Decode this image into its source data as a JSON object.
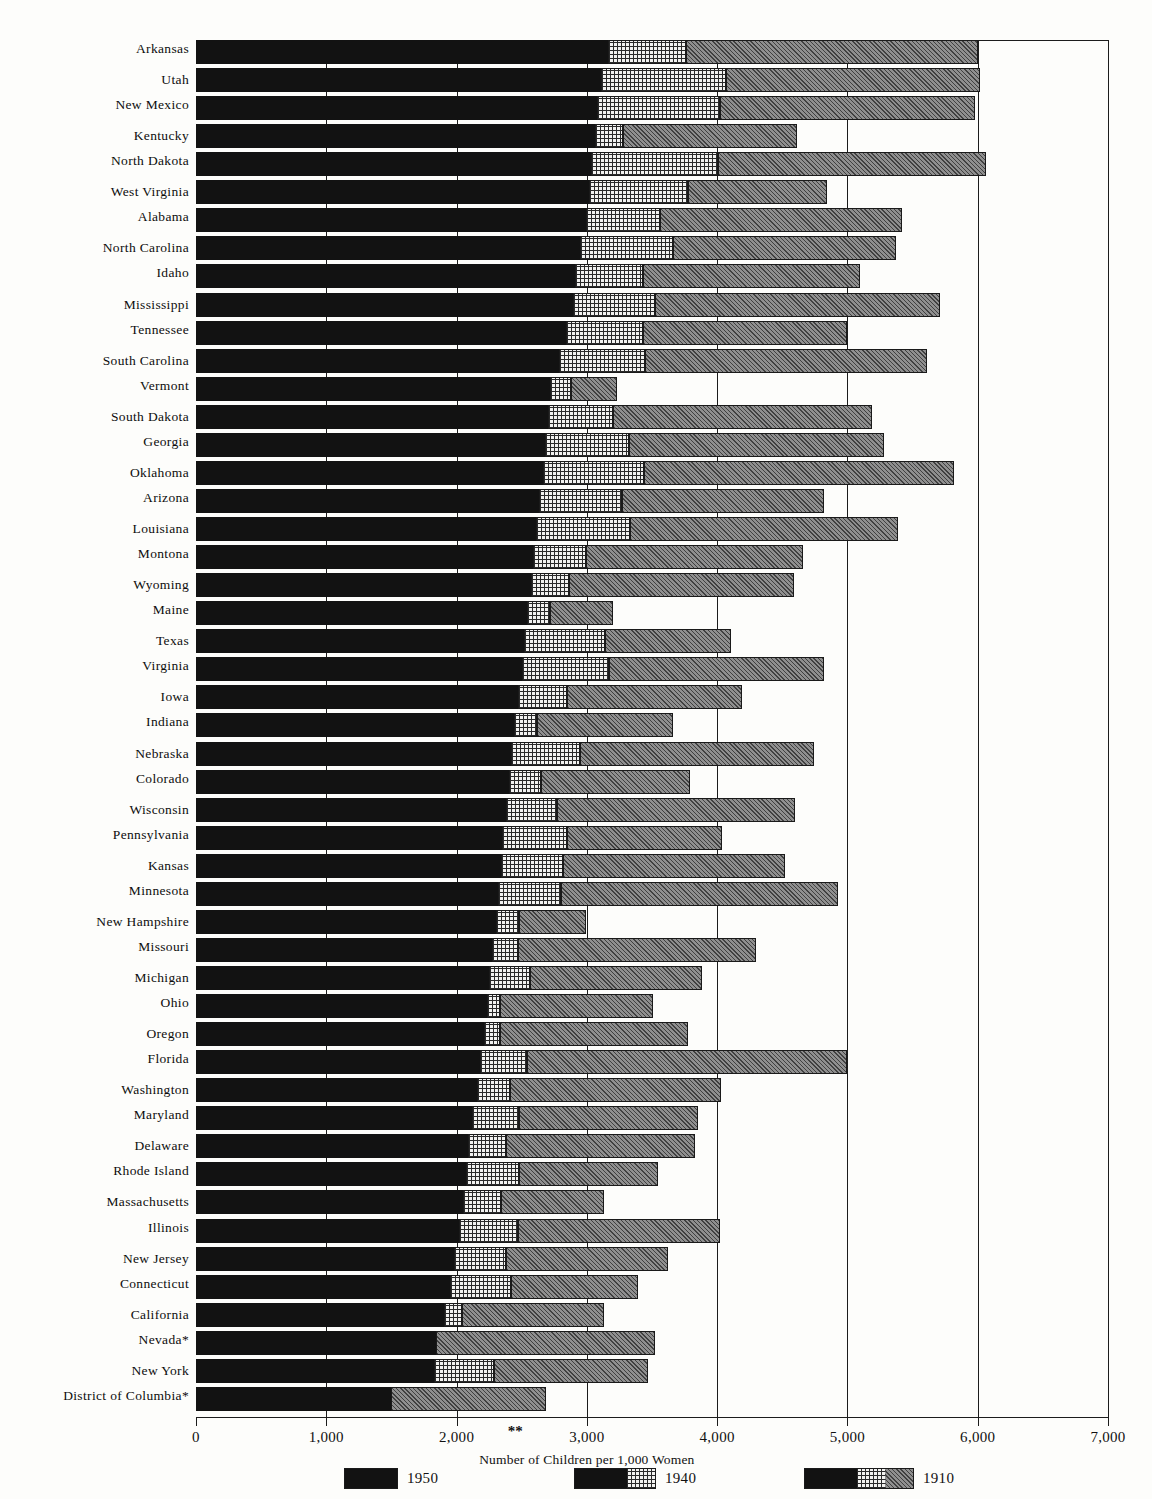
{
  "chart_data": {
    "type": "bar",
    "orientation": "horizontal",
    "subtype": "grouped-overlay-horizontal-bar",
    "title": "",
    "xlabel": "Number of Children per 1,000 Women",
    "ylabel": "",
    "xlim": [
      0,
      7000
    ],
    "xticks": [
      0,
      1000,
      2000,
      3000,
      4000,
      5000,
      6000,
      7000
    ],
    "xtick_labels": [
      "0",
      "1,000",
      "2,000",
      "3,000",
      "4,000",
      "5,000",
      "6,000",
      "7,000"
    ],
    "grid": true,
    "grid_axis": "x",
    "legend_position": "bottom",
    "series": [
      {
        "name": "1950",
        "fill": "solid-black",
        "color": "#121212"
      },
      {
        "name": "1940",
        "fill": "cross-hatch-dot",
        "color": "#f2f2f0"
      },
      {
        "name": "1910",
        "fill": "diagonal-hatch-gray",
        "color": "#8f8f8f"
      }
    ],
    "annotations": [
      "**"
    ],
    "footnote_markers": [
      "*"
    ],
    "categories": [
      "Arkansas",
      "Utah",
      "New Mexico",
      "Kentucky",
      "North Dakota",
      "West Virginia",
      "Alabama",
      "North Carolina",
      "Idaho",
      "Mississippi",
      "Tennessee",
      "South Carolina",
      "Vermont",
      "South Dakota",
      "Georgia",
      "Oklahoma",
      "Arizona",
      "Louisiana",
      "Montona",
      "Wyoming",
      "Maine",
      "Texas",
      "Virginia",
      "Iowa",
      "Indiana",
      "Nebraska",
      "Colorado",
      "Wisconsin",
      "Pennsylvania",
      "Kansas",
      "Minnesota",
      "New Hampshire",
      "Missouri",
      "Michigan",
      "Ohio",
      "Oregon",
      "Florida",
      "Washington",
      "Maryland",
      "Delaware",
      "Rhode Island",
      "Massachusetts",
      "Illinois",
      "New Jersey",
      "Connecticut",
      "California",
      "Nevada*",
      "New York",
      "District of Columbia*"
    ],
    "rows": [
      {
        "state": "Arkansas",
        "v1950": 3160,
        "v1940": 3760,
        "v1910": 6000
      },
      {
        "state": "Utah",
        "v1950": 3110,
        "v1940": 4070,
        "v1910": 6020
      },
      {
        "state": "New Mexico",
        "v1950": 3080,
        "v1940": 4020,
        "v1910": 5980
      },
      {
        "state": "Kentucky",
        "v1950": 3060,
        "v1940": 3280,
        "v1910": 4610
      },
      {
        "state": "North Dakota",
        "v1950": 3030,
        "v1940": 4010,
        "v1910": 6060
      },
      {
        "state": "West Virginia",
        "v1950": 3020,
        "v1940": 3780,
        "v1910": 4840
      },
      {
        "state": "Alabama",
        "v1950": 2990,
        "v1940": 3560,
        "v1910": 5420
      },
      {
        "state": "North Carolina",
        "v1950": 2950,
        "v1940": 3660,
        "v1910": 5370
      },
      {
        "state": "Idaho",
        "v1950": 2910,
        "v1940": 3430,
        "v1910": 5100
      },
      {
        "state": "Mississippi",
        "v1950": 2890,
        "v1940": 3520,
        "v1910": 5710
      },
      {
        "state": "Tennessee",
        "v1950": 2840,
        "v1940": 3430,
        "v1910": 5000
      },
      {
        "state": "South Carolina",
        "v1950": 2790,
        "v1940": 3450,
        "v1910": 5610
      },
      {
        "state": "Vermont",
        "v1950": 2720,
        "v1940": 2880,
        "v1910": 3230
      },
      {
        "state": "South Dakota",
        "v1950": 2700,
        "v1940": 3200,
        "v1910": 5190
      },
      {
        "state": "Georgia",
        "v1950": 2680,
        "v1940": 3320,
        "v1910": 5280
      },
      {
        "state": "Oklahoma",
        "v1950": 2660,
        "v1940": 3440,
        "v1910": 5820
      },
      {
        "state": "Arizona",
        "v1950": 2630,
        "v1940": 3270,
        "v1910": 4820
      },
      {
        "state": "Louisiana",
        "v1950": 2610,
        "v1940": 3330,
        "v1910": 5390
      },
      {
        "state": "Montona",
        "v1950": 2590,
        "v1940": 2990,
        "v1910": 4660
      },
      {
        "state": "Wyoming",
        "v1950": 2570,
        "v1940": 2860,
        "v1910": 4590
      },
      {
        "state": "Maine",
        "v1950": 2540,
        "v1940": 2720,
        "v1910": 3200
      },
      {
        "state": "Texas",
        "v1950": 2520,
        "v1940": 3140,
        "v1910": 4110
      },
      {
        "state": "Virginia",
        "v1950": 2500,
        "v1940": 3170,
        "v1910": 4820
      },
      {
        "state": "Iowa",
        "v1950": 2470,
        "v1940": 2850,
        "v1910": 4190
      },
      {
        "state": "Indiana",
        "v1950": 2440,
        "v1940": 2620,
        "v1910": 3660
      },
      {
        "state": "Nebraska",
        "v1950": 2420,
        "v1940": 2950,
        "v1910": 4740
      },
      {
        "state": "Colorado",
        "v1950": 2400,
        "v1940": 2650,
        "v1910": 3790
      },
      {
        "state": "Wisconsin",
        "v1950": 2380,
        "v1940": 2770,
        "v1910": 4600
      },
      {
        "state": "Pennsylvania",
        "v1950": 2350,
        "v1940": 2850,
        "v1910": 4040
      },
      {
        "state": "Kansas",
        "v1950": 2340,
        "v1940": 2820,
        "v1910": 4520
      },
      {
        "state": "Minnesota",
        "v1950": 2320,
        "v1940": 2800,
        "v1910": 4930
      },
      {
        "state": "New Hampshire",
        "v1950": 2300,
        "v1940": 2480,
        "v1910": 2990
      },
      {
        "state": "Missouri",
        "v1950": 2270,
        "v1940": 2470,
        "v1910": 4300
      },
      {
        "state": "Michigan",
        "v1950": 2250,
        "v1940": 2560,
        "v1910": 3880
      },
      {
        "state": "Ohio",
        "v1950": 2230,
        "v1940": 2330,
        "v1910": 3510
      },
      {
        "state": "Oregon",
        "v1950": 2210,
        "v1940": 2330,
        "v1910": 3780
      },
      {
        "state": "Florida",
        "v1950": 2180,
        "v1940": 2540,
        "v1910": 5000
      },
      {
        "state": "Washington",
        "v1950": 2160,
        "v1940": 2410,
        "v1910": 4030
      },
      {
        "state": "Maryland",
        "v1950": 2120,
        "v1940": 2480,
        "v1910": 3850
      },
      {
        "state": "Delaware",
        "v1950": 2090,
        "v1940": 2380,
        "v1910": 3830
      },
      {
        "state": "Rhode Island",
        "v1950": 2070,
        "v1940": 2480,
        "v1910": 3550
      },
      {
        "state": "Massachusetts",
        "v1950": 2050,
        "v1940": 2340,
        "v1910": 3130
      },
      {
        "state": "Illinois",
        "v1950": 2020,
        "v1940": 2470,
        "v1910": 4020
      },
      {
        "state": "New Jersey",
        "v1950": 1980,
        "v1940": 2380,
        "v1910": 3620
      },
      {
        "state": "Connecticut",
        "v1950": 1950,
        "v1940": 2420,
        "v1910": 3390
      },
      {
        "state": "California",
        "v1950": 1900,
        "v1940": 2040,
        "v1910": 3130
      },
      {
        "state": "Nevada*",
        "v1950": 1840,
        "v1940": 1840,
        "v1910": 3520
      },
      {
        "state": "New York",
        "v1950": 1830,
        "v1940": 2290,
        "v1910": 3470
      },
      {
        "state": "District of Columbia*",
        "v1950": 1500,
        "v1940": 1500,
        "v1910": 2690
      }
    ]
  },
  "axis": {
    "x_title": "Number of Children per 1,000 Women",
    "tick_labels": [
      "0",
      "1,000",
      "2,000",
      "3,000",
      "4,000",
      "5,000",
      "6,000",
      "7,000"
    ],
    "double_star": "**"
  },
  "legend": {
    "items": [
      {
        "label": "1950",
        "parts": [
          "black"
        ]
      },
      {
        "label": "1940",
        "parts": [
          "black",
          "dot"
        ]
      },
      {
        "label": "1910",
        "parts": [
          "black",
          "dot",
          "hatch"
        ]
      }
    ]
  }
}
